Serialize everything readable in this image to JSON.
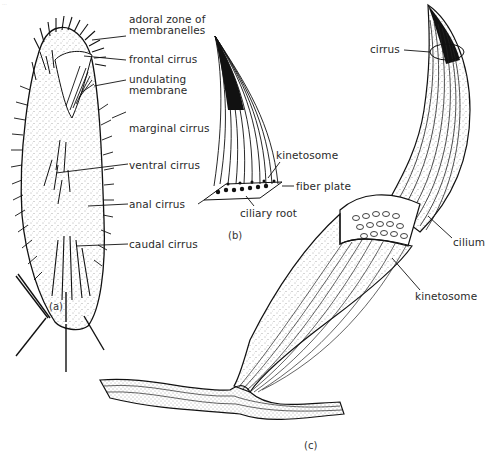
{
  "figure": {
    "header_text": "...",
    "panels": [
      {
        "id": "a",
        "panel_label": "(a)",
        "subject": "hypotrich ciliate (whole cell, ventral view)",
        "labels": [
          {
            "text_line1": "adoral zone of",
            "text_line2": "membranelles"
          },
          {
            "text_line1": "frontal cirrus"
          },
          {
            "text_line1": "undulating",
            "text_line2": "membrane"
          },
          {
            "text_line1": "marginal cirrus"
          },
          {
            "text_line1": "ventral cirrus"
          },
          {
            "text_line1": "anal cirrus"
          },
          {
            "text_line1": "caudal cirrus"
          }
        ]
      },
      {
        "id": "b",
        "panel_label": "(b)",
        "subject": "single cirrus",
        "labels": [
          {
            "text_line1": "kinetosome"
          },
          {
            "text_line1": "fiber plate"
          },
          {
            "text_line1": "ciliary root"
          }
        ]
      },
      {
        "id": "c",
        "panel_label": "(c)",
        "subject": "cirrus cross-section and base",
        "labels": [
          {
            "text_line1": "cirrus"
          },
          {
            "text_line1": "cilium"
          },
          {
            "text_line1": "kinetosome"
          }
        ]
      }
    ]
  },
  "colors": {
    "ink": "#111111",
    "text": "#2a2a2a",
    "stipple": "#555555",
    "background": "#ffffff"
  }
}
